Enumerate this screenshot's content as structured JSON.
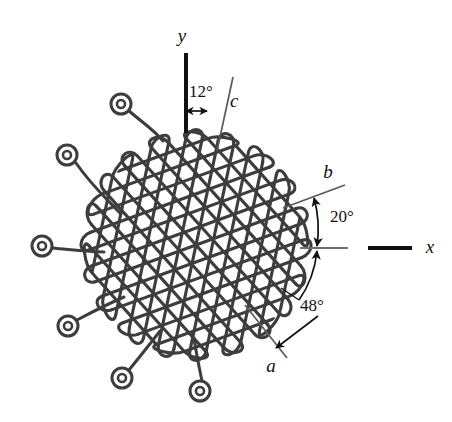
{
  "figure": {
    "type": "triaxial-woven-fabric-diagram",
    "background_color": "#ffffff",
    "line_color": "#3d3d3d",
    "axis_color": "#111111",
    "thin_axis_color": "#6e6e6e"
  },
  "axes": [
    {
      "id": "y",
      "label": "y",
      "orientation": "vertical",
      "label_x": 182,
      "label_y": 42
    },
    {
      "id": "x",
      "label": "x",
      "orientation": "horizontal",
      "label_x": 430,
      "label_y": 253
    }
  ],
  "fiber_axes": [
    {
      "id": "a",
      "label": "a",
      "angle_deg": -48,
      "reference": "x",
      "label_x": 271,
      "label_y": 372
    },
    {
      "id": "b",
      "label": "b",
      "angle_deg": 20,
      "reference": "x",
      "label_x": 328,
      "label_y": 178
    },
    {
      "id": "c",
      "label": "c",
      "angle_deg": 12,
      "reference": "y",
      "label_x": 230,
      "label_y": 107
    }
  ],
  "angles": [
    {
      "id": "angle-c",
      "value": "12°",
      "from": "y",
      "to": "c",
      "label_x": 189,
      "label_y": 97
    },
    {
      "id": "angle-b",
      "value": "20°",
      "from": "x",
      "to": "b",
      "label_x": 330,
      "label_y": 222
    },
    {
      "id": "angle-a",
      "value": "48°",
      "from": "x",
      "to": "a",
      "label_x": 300,
      "label_y": 311
    }
  ],
  "weave": {
    "description": "triaxial serpentine filament weave",
    "center_x": 196,
    "center_y": 245,
    "radius": 108,
    "families": [
      {
        "id": "family-a",
        "angle_deg": -48,
        "count": 13,
        "spacing": 16
      },
      {
        "id": "family-b",
        "angle_deg": 20,
        "count": 13,
        "spacing": 16
      },
      {
        "id": "family-c",
        "angle_deg": 78,
        "count": 13,
        "spacing": 16
      }
    ]
  },
  "terminals": [
    {
      "id": "terminal-1",
      "cx": 121,
      "cy": 104,
      "r_outer": 10,
      "r_inner": 4
    },
    {
      "id": "terminal-2",
      "cx": 67,
      "cy": 155,
      "r_outer": 10,
      "r_inner": 4
    },
    {
      "id": "terminal-3",
      "cx": 42,
      "cy": 246,
      "r_outer": 10,
      "r_inner": 4
    },
    {
      "id": "terminal-4",
      "cx": 68,
      "cy": 326,
      "r_outer": 10,
      "r_inner": 4
    },
    {
      "id": "terminal-5",
      "cx": 122,
      "cy": 378,
      "r_outer": 10,
      "r_inner": 4
    },
    {
      "id": "terminal-6",
      "cx": 200,
      "cy": 391,
      "r_outer": 10,
      "r_inner": 4
    }
  ]
}
